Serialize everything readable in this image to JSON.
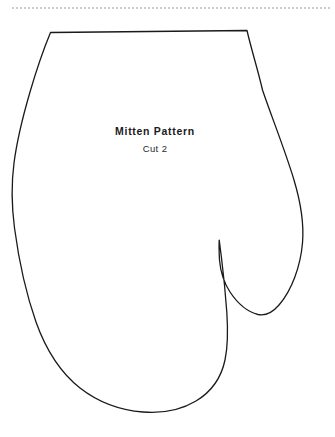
{
  "page": {
    "background_color": "#ffffff",
    "width": 335,
    "height": 437
  },
  "top_rule": {
    "name": "page-edge-dashed-rule",
    "color": "#b9b9b9",
    "dash": "2 2",
    "y": 8,
    "x_start": 12,
    "x_end": 331
  },
  "pattern": {
    "title": "Mitten Pattern",
    "instruction": "Cut 2",
    "outline_color": "#1a1a1a",
    "outline_width": 1.3,
    "fill_color": "#ffffff",
    "shape_name": "mitten-outline",
    "path": "M 50.5 32.5 L 247 30.5 C 252 52 258 70 262.5 90 C 272 118 285 150 294 180 C 301.5 205 304 225 302.5 243 C 300.5 266 292 290 279 305 C 272.5 312.5 265 316 258 314.5 C 248 312 238 304 230 292 C 224.5 283.5 220.5 272 219.5 260 C 219 251 219 245 219.2 240.2 C 219.6 243 220.5 250 221.5 258 C 223.5 274 225.5 294 226.8 312 C 228 330 228 346 225 360 C 221 379 211 392 196 401 C 181 410 162 413.5 143 412 C 121 410.3 98 402 80 388 C 61 373 46 350 36 322 C 25.5 292 18.5 258 14.5 228 C 11 201 11.5 182 14 163 C 17 140 23 116 30 92 C 37 68 44.5 47 50.5 32.5 Z"
  }
}
